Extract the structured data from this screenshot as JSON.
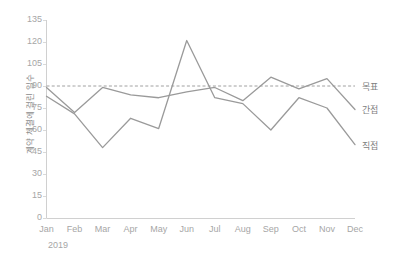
{
  "chart_data": {
    "type": "line",
    "title": "",
    "subtitle": "",
    "xlabel": "",
    "ylabel": "계약 체결에 걸린 일수",
    "categories": [
      "Jan",
      "Feb",
      "Mar",
      "Apr",
      "May",
      "Jun",
      "Jul",
      "Aug",
      "Sep",
      "Oct",
      "Nov",
      "Dec"
    ],
    "period_label": "2019",
    "ylim": [
      0,
      135
    ],
    "ytick_values": [
      0,
      15,
      30,
      45,
      60,
      75,
      90,
      105,
      120,
      135
    ],
    "ytick_labels": [
      "0",
      "15",
      "30",
      "45",
      "60",
      "75",
      "90",
      "105",
      "120",
      "135"
    ],
    "grid": false,
    "legend_position": "right-inline",
    "series": [
      {
        "name": "목표",
        "style": "dashed",
        "color": "#a0a0a0",
        "constant_value": 90,
        "values": [
          90,
          90,
          90,
          90,
          90,
          90,
          90,
          90,
          90,
          90,
          90,
          90
        ]
      },
      {
        "name": "간접",
        "style": "solid",
        "color": "#9a9a9a",
        "values": [
          89,
          72,
          89,
          84,
          82,
          86,
          89,
          80,
          96,
          88,
          95,
          74
        ]
      },
      {
        "name": "직접",
        "style": "solid",
        "color": "#9a9a9a",
        "values": [
          83,
          71,
          48,
          68,
          61,
          121,
          82,
          78,
          60,
          82,
          75,
          50
        ]
      }
    ],
    "annotations": []
  },
  "axis": {
    "y_title": "계약 체결에 걸린 일수"
  }
}
